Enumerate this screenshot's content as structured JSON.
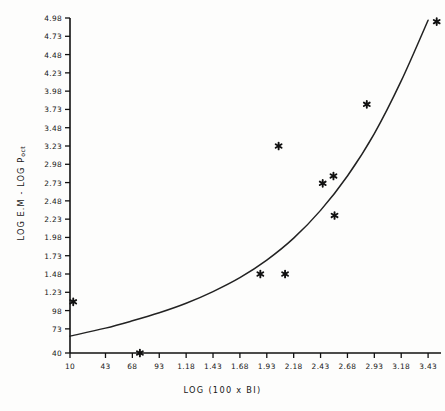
{
  "chart_data": {
    "type": "scatter",
    "title": "",
    "xlabel": "LOG (100 x BI)",
    "ylabel_main": "LOG E.M - LOG P",
    "ylabel_sub": "oct",
    "xlim": [
      0.1,
      3.55
    ],
    "ylim": [
      0.4,
      4.98
    ],
    "grid": false,
    "legend": "none",
    "marker": "asterisk",
    "x_ticks": [
      0.1,
      0.43,
      0.68,
      0.93,
      1.18,
      1.43,
      1.68,
      1.93,
      2.18,
      2.43,
      2.68,
      2.93,
      3.18,
      3.43
    ],
    "x_tick_labels": [
      "10",
      "43",
      "68",
      "93",
      "1.18",
      "1.43",
      "1.68",
      "1.93",
      "2.18",
      "2.43",
      "2.68",
      "2.93",
      "3.18",
      "3.43"
    ],
    "y_ticks": [
      0.4,
      0.73,
      0.98,
      1.23,
      1.48,
      1.73,
      1.98,
      2.23,
      2.48,
      2.73,
      2.98,
      3.23,
      3.48,
      3.73,
      3.98,
      4.23,
      4.48,
      4.73,
      4.98
    ],
    "y_tick_labels": [
      "40",
      "73",
      "98",
      "1.23",
      "1.48",
      "1.73",
      "1.98",
      "2.23",
      "2.48",
      "2.73",
      "2.98",
      "3.23",
      "3.48",
      "3.73",
      "3.98",
      "4.23",
      "4.48",
      "4.73",
      "4.98"
    ],
    "points": [
      {
        "x": 0.13,
        "y": 1.1
      },
      {
        "x": 0.75,
        "y": 0.4
      },
      {
        "x": 1.87,
        "y": 1.48
      },
      {
        "x": 2.1,
        "y": 1.48
      },
      {
        "x": 2.04,
        "y": 3.23
      },
      {
        "x": 2.45,
        "y": 2.72
      },
      {
        "x": 2.55,
        "y": 2.82
      },
      {
        "x": 2.56,
        "y": 2.28
      },
      {
        "x": 2.86,
        "y": 3.8
      },
      {
        "x": 3.51,
        "y": 4.93
      }
    ],
    "curve": {
      "name": "fitted-curve",
      "description": "monotonic rising exponential fit",
      "points": [
        {
          "x": 0.1,
          "y": 0.63
        },
        {
          "x": 0.43,
          "y": 0.74
        },
        {
          "x": 0.68,
          "y": 0.84
        },
        {
          "x": 0.93,
          "y": 0.95
        },
        {
          "x": 1.18,
          "y": 1.08
        },
        {
          "x": 1.43,
          "y": 1.24
        },
        {
          "x": 1.68,
          "y": 1.43
        },
        {
          "x": 1.93,
          "y": 1.67
        },
        {
          "x": 2.18,
          "y": 1.97
        },
        {
          "x": 2.43,
          "y": 2.35
        },
        {
          "x": 2.68,
          "y": 2.82
        },
        {
          "x": 2.93,
          "y": 3.4
        },
        {
          "x": 3.18,
          "y": 4.12
        },
        {
          "x": 3.43,
          "y": 4.95
        }
      ]
    },
    "colors": {
      "axis": "#111111",
      "marker": "#111111",
      "curve": "#222222",
      "background": "#fdfdfc"
    }
  }
}
